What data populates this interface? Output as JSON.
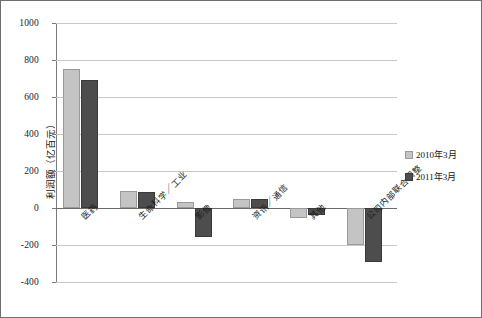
{
  "chart_data": {
    "type": "bar",
    "title": "",
    "subtitle": "",
    "xlabel": "",
    "ylabel": "利润额（亿百元）",
    "ylim": [
      -400,
      1000
    ],
    "ytick_labels": [
      "1000",
      "800",
      "600",
      "400",
      "200",
      "0",
      "-200",
      "-400"
    ],
    "ytick_values": [
      1000,
      800,
      600,
      400,
      200,
      0,
      -200,
      -400
    ],
    "grid": true,
    "legend_position": "right",
    "categories": [
      "医药",
      "生命科学／工业",
      "影像",
      "资讯／通信",
      "其他",
      "公司内部联合调整"
    ],
    "series": [
      {
        "name": "2010年3月",
        "color": "#c4c4c4",
        "values": [
          750,
          90,
          30,
          50,
          -55,
          -200
        ]
      },
      {
        "name": "2011年3月",
        "color": "#4d4d4d",
        "values": [
          690,
          85,
          -155,
          50,
          -40,
          -290
        ]
      }
    ]
  },
  "legend": {
    "items": [
      {
        "label": "2010年3月"
      },
      {
        "label": "2011年3月"
      }
    ]
  }
}
